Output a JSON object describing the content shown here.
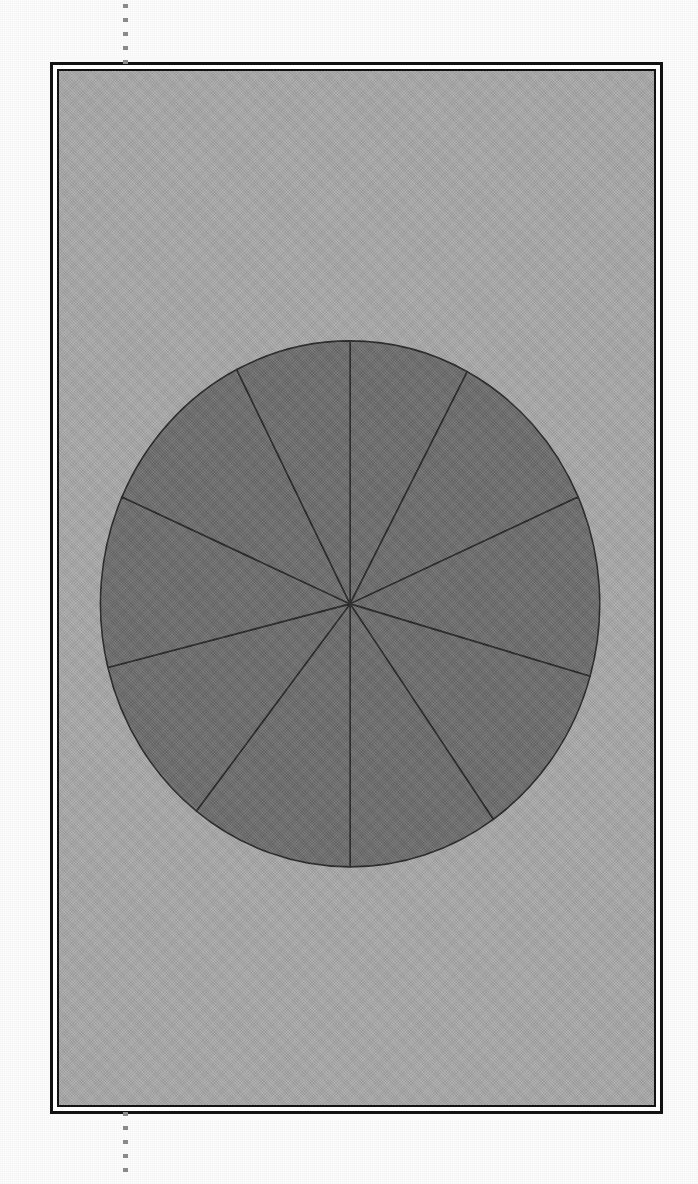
{
  "page": {
    "background_color": "#fbfbfb",
    "plate_background_color": "#a9a9a9",
    "frame_color": "#111111",
    "crop_guide": {
      "name": "vertical dotted registration guide",
      "color": "#8a8a8a",
      "x": 125
    }
  },
  "figure": {
    "caption": "",
    "title": "",
    "frame_style": "double-ruled rectangle"
  },
  "chart_data": {
    "type": "pie",
    "title": "",
    "subtitle": "",
    "xlabel": "",
    "ylabel": "",
    "legend": [],
    "legend_position": "none",
    "grid": false,
    "labels_shown": false,
    "slice_color": "#6d6d6d",
    "edge_color": "#272727",
    "background_color": "#a9a9a9",
    "start_angle_deg": 90,
    "direction": "clockwise",
    "center": {
      "x": 352,
      "y": 606
    },
    "radius": {
      "rx": 253,
      "ry": 265
    },
    "categories": [
      "Slice 1",
      "Slice 2",
      "Slice 3",
      "Slice 4",
      "Slice 5",
      "Slice 6",
      "Slice 7",
      "Slice 8",
      "Slice 9",
      "Slice 10"
    ],
    "values": [
      27,
      40,
      38,
      29,
      35,
      38,
      38,
      22,
      39,
      54
    ],
    "percentages": [
      7.5,
      11.1,
      10.6,
      8.1,
      9.7,
      10.6,
      10.6,
      6.1,
      10.8,
      15.0
    ],
    "boundary_angles_deg": [
      90,
      62,
      24,
      344,
      305,
      270,
      232,
      194,
      156,
      117
    ],
    "slice_angles_deg": [
      28,
      38,
      40,
      39,
      35,
      38,
      38,
      38,
      39,
      27
    ],
    "slice_count": 10
  }
}
